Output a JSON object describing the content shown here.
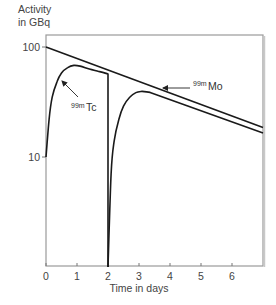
{
  "chart_data": {
    "type": "line",
    "title": "",
    "ylabel_lines": [
      "Activity",
      "in GBq"
    ],
    "xlabel": "Time in days",
    "yscale": "log",
    "xlim": [
      0,
      7
    ],
    "ylim": [
      1,
      100
    ],
    "grid": false,
    "x_ticks": [
      0,
      1,
      2,
      3,
      4,
      5,
      6
    ],
    "x_tick_labels": [
      "0",
      "1",
      "2",
      "3",
      "4",
      "5",
      "6"
    ],
    "y_ticks": [
      10,
      100
    ],
    "y_tick_labels": [
      "10",
      "100"
    ],
    "series": [
      {
        "name": "99m Mo (upper line)",
        "x": [
          0,
          7
        ],
        "y": [
          100,
          18.5
        ]
      },
      {
        "name": "99m Mo (lower line)",
        "x": [
          0.95,
          7
        ],
        "y": [
          68,
          16.5
        ]
      },
      {
        "name": "99m Tc (first elution cycle)",
        "x": [
          0,
          0.1,
          0.2,
          0.35,
          0.5,
          0.7,
          0.9,
          1.1,
          1.4,
          1.7,
          2.0,
          2.0
        ],
        "y": [
          10,
          22,
          35,
          48,
          58,
          65,
          68,
          67,
          63,
          60,
          57,
          1
        ]
      },
      {
        "name": "99m Tc (second elution cycle)",
        "x": [
          2.0,
          2.1,
          2.2,
          2.35,
          2.5,
          2.7,
          2.9,
          3.1
        ],
        "y": [
          1,
          7,
          14,
          22,
          29,
          35,
          38.5,
          39.5
        ]
      }
    ],
    "annotations": [
      {
        "label_sup": "99m",
        "label": "Tc",
        "points_to": "99m Tc curve near day 0.6"
      },
      {
        "label_sup": "99m",
        "label": "Mo",
        "points_to": "99m Mo line near day 3.5"
      }
    ]
  }
}
